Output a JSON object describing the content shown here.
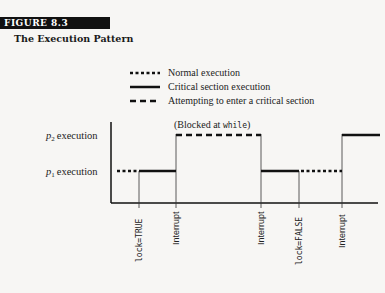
{
  "figure": {
    "badge": "FIGURE 8.3",
    "title": "The Execution Pattern"
  },
  "legend": {
    "items": [
      {
        "style": "dotted",
        "label": "Normal execution"
      },
      {
        "style": "solid",
        "label": "Critical section execution"
      },
      {
        "style": "dashed",
        "label": "Attempting to enter a critical section"
      }
    ]
  },
  "diagram": {
    "rows": [
      {
        "id": "p2",
        "symbol": "p",
        "subscript": "2",
        "label": "execution"
      },
      {
        "id": "p1",
        "symbol": "p",
        "subscript": "1",
        "label": "execution"
      }
    ],
    "annotation_prefix": "(Blocked at ",
    "annotation_code": "while",
    "annotation_suffix": ")",
    "events": [
      {
        "label": "lock=TRUE",
        "mono": true
      },
      {
        "label": "Interrupt",
        "mono": false
      },
      {
        "label": "Interrupt",
        "mono": false
      },
      {
        "label": "lock=FALSE",
        "mono": true
      },
      {
        "label": "Interrupt",
        "mono": false
      }
    ],
    "segments": [
      {
        "row": "p1",
        "style": "dotted",
        "from": "start",
        "to": "lock=TRUE"
      },
      {
        "row": "p1",
        "style": "solid",
        "from": "lock=TRUE",
        "to": "Interrupt 1"
      },
      {
        "row": "p2",
        "style": "dashed",
        "from": "Interrupt 1",
        "to": "Interrupt 2"
      },
      {
        "row": "p1",
        "style": "solid",
        "from": "Interrupt 2",
        "to": "lock=FALSE"
      },
      {
        "row": "p1",
        "style": "dotted",
        "from": "lock=FALSE",
        "to": "Interrupt 3"
      },
      {
        "row": "p2",
        "style": "solid",
        "from": "Interrupt 3",
        "to": "end"
      }
    ]
  }
}
